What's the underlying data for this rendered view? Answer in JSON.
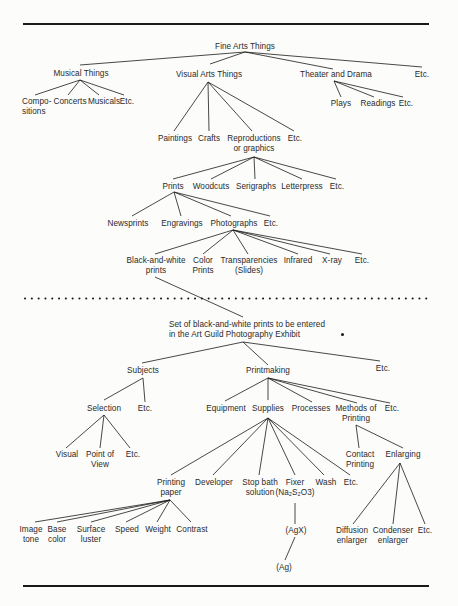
{
  "colors": {
    "ink": "#1a1a1a",
    "text": "#2a2a2a",
    "paper": "#fcfcfa"
  },
  "top_tree": {
    "root": "Fine Arts Things",
    "level1": {
      "musical": "Musical Things",
      "visual": "Visual Arts Things",
      "theater": "Theater and Drama",
      "etc": "Etc."
    },
    "musical_children": {
      "compositions_1": "Compo-",
      "compositions_2": "sitions",
      "concerts": "Concerts",
      "musicals": "Musicals",
      "etc": "Etc."
    },
    "theater_children": {
      "plays": "Plays",
      "readings": "Readings",
      "etc": "Etc."
    },
    "visual_children": {
      "paintings": "Paintings",
      "crafts": "Crafts",
      "reproductions_1": "Reproductions",
      "reproductions_2": "or graphics",
      "etc": "Etc."
    },
    "reproductions_children": {
      "prints": "Prints",
      "woodcuts": "Woodcuts",
      "serigraphs": "Serigraphs",
      "letterpress": "Letterpress",
      "etc": "Etc."
    },
    "prints_children": {
      "newsprints": "Newsprints",
      "engravings": "Engravings",
      "photographs": "Photographs",
      "etc": "Etc."
    },
    "photographs_children": {
      "bw_1": "Black-and-white",
      "bw_2": "prints",
      "color_1": "Color",
      "color_2": "Prints",
      "transp_1": "Transparencies",
      "transp_2": "(Slides)",
      "infrared": "Infrared",
      "xray": "X-ray",
      "etc": "Etc."
    }
  },
  "bottom_tree": {
    "root_1": "Set of black-and-white prints to be entered",
    "root_2": "in the Art Guild Photography Exhibit",
    "level1": {
      "subjects": "Subjects",
      "printmaking": "Printmaking",
      "etc": "Etc."
    },
    "subjects_children": {
      "selection": "Selection",
      "etc": "Etc."
    },
    "selection_children": {
      "visual": "Visual",
      "pov_1": "Point of",
      "pov_2": "View",
      "etc": "Etc."
    },
    "printmaking_children": {
      "equipment": "Equipment",
      "supplies": "Supplies",
      "processes": "Processes",
      "methods_1": "Methods of",
      "methods_2": "Printing",
      "etc": "Etc."
    },
    "supplies_children": {
      "paper_1": "Printing",
      "paper_2": "paper",
      "developer": "Developer",
      "stop_1": "Stop bath",
      "stop_2": "solution",
      "fixer_1": "Fixer",
      "fixer_2": "(Na₂S₂O3)",
      "wash": "Wash",
      "etc": "Etc."
    },
    "paper_children": {
      "tone_1": "Image",
      "tone_2": "tone",
      "base_1": "Base",
      "base_2": "color",
      "luster_1": "Surface",
      "luster_2": "luster",
      "speed": "Speed",
      "weight": "Weight",
      "contrast": "Contrast"
    },
    "fixer_chain": {
      "agx": "(AgX)",
      "ag": "(Ag)"
    },
    "methods_children": {
      "contact_1": "Contact",
      "contact_2": "Printing",
      "enlarging": "Enlarging"
    },
    "enlarging_children": {
      "diffusion_1": "Diffusion",
      "diffusion_2": "enlarger",
      "condenser_1": "Condenser",
      "condenser_2": "enlarger",
      "etc": "Etc."
    }
  }
}
